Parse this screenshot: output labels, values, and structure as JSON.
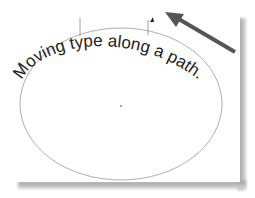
{
  "canvas": {
    "path_text": "Moving type along a path.",
    "text_color": "#222222",
    "path_color": "#8a8a8a",
    "arrow_color": "#555555",
    "ellipse": {
      "cx": 121,
      "cy": 104,
      "rx": 101,
      "ry": 76
    }
  }
}
